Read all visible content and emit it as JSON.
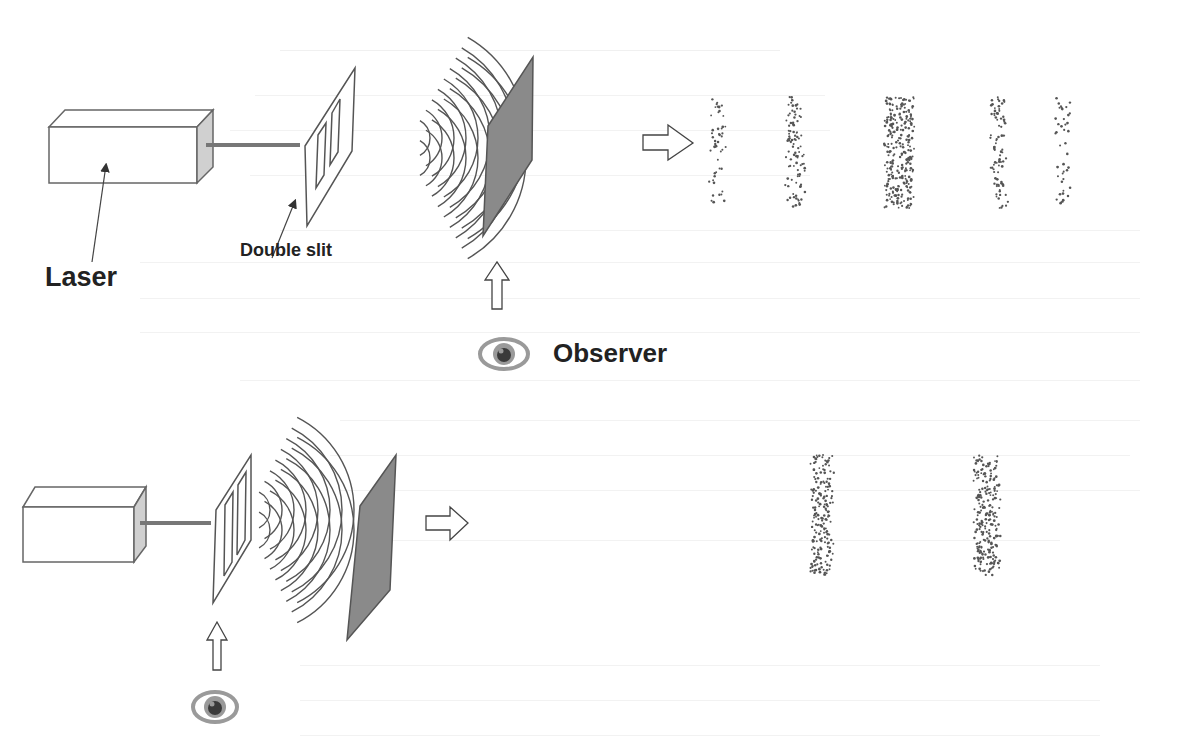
{
  "diagram": {
    "labels": {
      "laser": "Laser",
      "double_slit": "Double slit",
      "observer": "Observer"
    },
    "panels": [
      {
        "name": "top",
        "observer_position": "at screen",
        "pattern": "interference",
        "band_count": 5,
        "band_densities": [
          0.35,
          0.6,
          1.0,
          0.6,
          0.35
        ]
      },
      {
        "name": "bottom",
        "observer_position": "at slits",
        "pattern": "two bands",
        "band_count": 2,
        "band_densities": [
          0.9,
          0.9
        ]
      }
    ],
    "colors": {
      "stroke": "#555555",
      "screen": "#8a8a8a",
      "laser_end": "#d0d0d0",
      "eye_iris": "#8c8c8c",
      "eye_pupil": "#3a3a3a",
      "text": "#222222"
    }
  }
}
